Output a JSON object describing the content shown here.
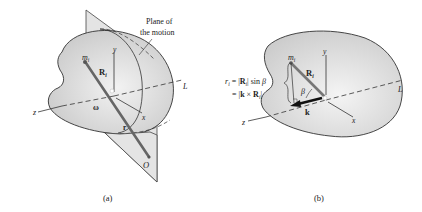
{
  "figure": {
    "panel_a": {
      "caption": "(a)",
      "plane_label_line1": "Plane of",
      "plane_label_line2": "the motion",
      "mass_label": "m",
      "mass_subscript": "i",
      "position_vector_label": "R",
      "position_vector_subscript": "i",
      "angular_velocity_label": "ω",
      "radius_vector_label": "r",
      "point_label": "O",
      "axis_x": "x",
      "axis_y": "y",
      "axis_z": "z",
      "axis_L": "L"
    },
    "panel_b": {
      "caption": "(b)",
      "mass_label": "m",
      "mass_subscript": "i",
      "position_vector_label": "R",
      "position_vector_subscript": "i",
      "angle_label": "β",
      "unit_vector_label": "k",
      "equation_line1": "r_i = |R_i| sin β",
      "equation_line2": "= |k × R_i|",
      "eq1_r": "r",
      "eq1_sub": "i",
      "eq1_eq": " = |",
      "eq1_R": "R",
      "eq1_Rsub": "i",
      "eq1_rest": "| sin ",
      "eq1_beta": "β",
      "eq2_eq": "= |",
      "eq2_k": "k",
      "eq2_times": " × ",
      "eq2_R": "R",
      "eq2_Rsub": "i",
      "eq2_end": "|",
      "axis_x": "x",
      "axis_y": "y",
      "axis_z": "z",
      "axis_L": "L"
    }
  },
  "colors": {
    "body_fill": "#d9d9d9",
    "plane_fill": "#e6e6e6",
    "vector": "#6b6b6b",
    "outline": "#333333"
  }
}
